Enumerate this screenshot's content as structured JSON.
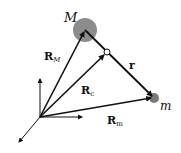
{
  "diagram": {
    "type": "vector-diagram",
    "colors": {
      "stroke": "#111111",
      "big_mass_fill": "#8c8c8c",
      "small_mass_fill": "#7a7a7a",
      "background": "#ffffff"
    },
    "nodes": {
      "origin": {
        "x": 40,
        "y": 117
      },
      "big_mass": {
        "label": "M",
        "x": 85,
        "y": 30,
        "r": 12
      },
      "center_of_mass": {
        "x": 107,
        "y": 52,
        "r": 3
      },
      "small_mass": {
        "label": "m",
        "x": 154,
        "y": 98,
        "r": 5
      }
    },
    "vectors": [
      {
        "name": "R_M",
        "main": "R",
        "sub": "M",
        "from": "origin",
        "to": "big_mass"
      },
      {
        "name": "R_c",
        "main": "R",
        "sub": "c",
        "from": "origin",
        "to": "center_of_mass"
      },
      {
        "name": "R_m",
        "main": "R",
        "sub": "m",
        "from": "origin",
        "to": "small_mass"
      },
      {
        "name": "r",
        "main": "r",
        "sub": "",
        "from": "big_mass",
        "to": "small_mass"
      }
    ],
    "axes": [
      "up",
      "right",
      "down-left"
    ]
  },
  "labels": {
    "big_mass": "M",
    "small_mass": "m",
    "RM_main": "R",
    "RM_sub": "M",
    "Rc_main": "R",
    "Rc_sub": "c",
    "Rm_main": "R",
    "Rm_sub": "m",
    "r": "r"
  }
}
